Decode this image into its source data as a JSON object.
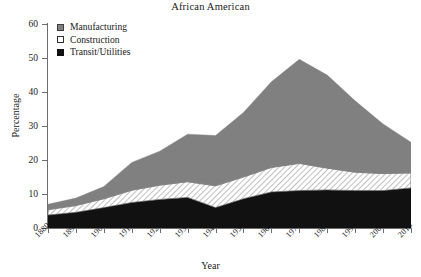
{
  "chart_data": {
    "type": "area",
    "stacked": true,
    "title": "African American",
    "xlabel": "Year",
    "ylabel": "Percentage",
    "xlim": [
      1880,
      2010
    ],
    "ylim": [
      0,
      60
    ],
    "ytick_step": 10,
    "grid": false,
    "legend_position": "top-left",
    "x": [
      1880,
      1890,
      1900,
      1910,
      1920,
      1930,
      1940,
      1950,
      1960,
      1970,
      1980,
      1990,
      2000,
      2010
    ],
    "xticklabels": [
      "1880",
      "1890",
      "1900",
      "1910",
      "1920",
      "1930",
      "1940",
      "1950",
      "1960",
      "1970",
      "1980",
      "1990",
      "2000",
      "2010"
    ],
    "yticklabels": [
      "0",
      "10",
      "20",
      "30",
      "40",
      "50",
      "60"
    ],
    "yticks": [
      0,
      10,
      20,
      30,
      40,
      50,
      60
    ],
    "series": [
      {
        "name": "Transit/Utilities",
        "color": "#111111",
        "fill": "solid",
        "values": [
          3.8,
          4.6,
          6.0,
          7.5,
          8.4,
          9.0,
          6.0,
          8.6,
          10.6,
          11.0,
          11.2,
          11.0,
          11.0,
          11.8
        ]
      },
      {
        "name": "Construction",
        "color": "#ffffff",
        "fill": "hatched",
        "values": [
          1.6,
          2.0,
          2.6,
          3.6,
          4.2,
          4.6,
          6.4,
          6.4,
          7.2,
          8.0,
          6.4,
          5.4,
          5.0,
          4.4
        ]
      },
      {
        "name": "Manufacturing",
        "color": "#808080",
        "fill": "solid",
        "values": [
          1.6,
          2.2,
          3.6,
          8.2,
          10.0,
          14.0,
          14.8,
          19.0,
          25.2,
          30.6,
          27.4,
          21.0,
          14.6,
          9.0
        ]
      }
    ],
    "totals": [
      7.0,
      8.8,
      12.2,
      19.3,
      22.6,
      27.6,
      27.2,
      34.0,
      43.0,
      49.6,
      45.0,
      37.4,
      30.6,
      25.2
    ]
  },
  "legend": {
    "items": [
      {
        "label": "Manufacturing",
        "swatch": "manufacturing-swatch"
      },
      {
        "label": "Construction",
        "swatch": "construction-swatch"
      },
      {
        "label": "Transit/Utilities",
        "swatch": "transit-utilities-swatch"
      }
    ]
  }
}
